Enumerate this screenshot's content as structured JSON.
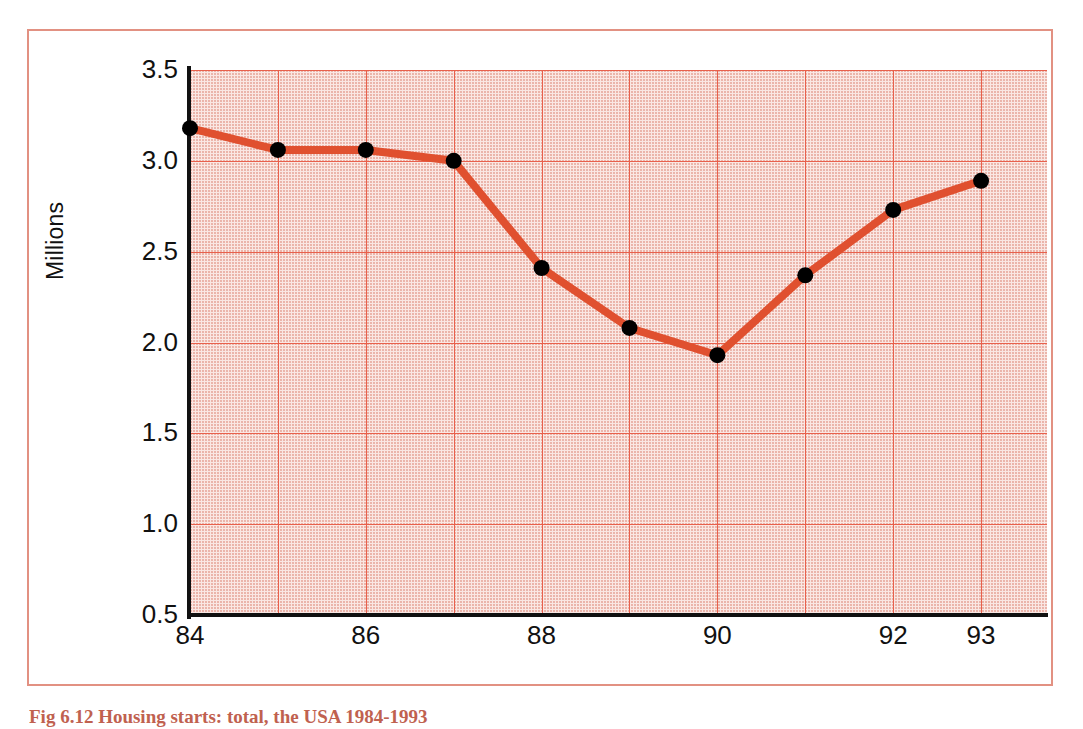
{
  "figure": {
    "caption": "Fig 6.12  Housing starts: total, the USA 1984-1993",
    "frame_color": "#e29182"
  },
  "chart_data": {
    "type": "line",
    "title": "",
    "subtitle": "",
    "xlabel": "",
    "ylabel": "Millions",
    "categories": [
      "84",
      "85",
      "86",
      "87",
      "88",
      "89",
      "90",
      "91",
      "92",
      "93"
    ],
    "x_tick_labels": [
      "84",
      "86",
      "88",
      "90",
      "92",
      "93"
    ],
    "values": [
      3.18,
      3.06,
      3.06,
      3.0,
      2.41,
      2.08,
      1.93,
      2.37,
      2.73,
      2.89
    ],
    "series": [
      {
        "name": "Housing starts",
        "values": [
          3.18,
          3.06,
          3.06,
          3.0,
          2.41,
          2.08,
          1.93,
          2.37,
          2.73,
          2.89
        ],
        "line_color": "#e0502f",
        "marker_color": "#000000",
        "marker": "circle"
      }
    ],
    "y_tick_labels": [
      "3.5",
      "3.0",
      "2.5",
      "2.0",
      "1.5",
      "1.0",
      "0.5"
    ],
    "y_ticks": [
      3.5,
      3.0,
      2.5,
      2.0,
      1.5,
      1.0,
      0.5
    ],
    "ylim": [
      0.5,
      3.5
    ],
    "xlim": [
      "84",
      "93"
    ],
    "grid": true,
    "grid_color": "#e8604c",
    "plot_background": "#fae7e3",
    "axis_color": "#111111",
    "legend": false,
    "legend_position": "none"
  }
}
